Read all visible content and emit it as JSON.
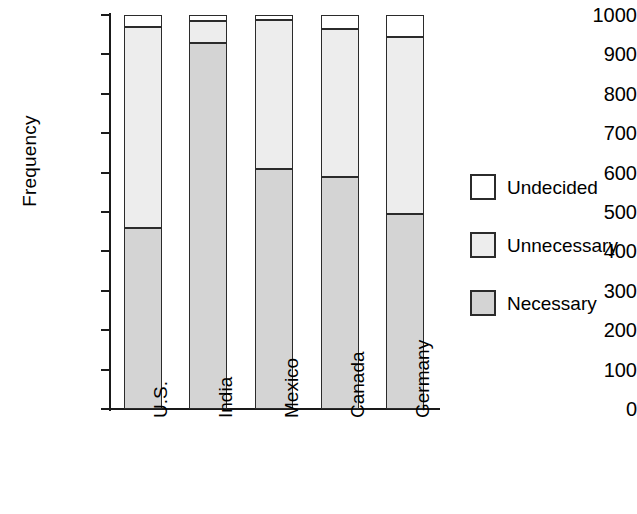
{
  "chart_data": {
    "type": "bar",
    "subtype": "stacked-bar",
    "title": "",
    "xlabel": "",
    "ylabel": "Frequency",
    "categories": [
      "U.S.",
      "India",
      "Mexico",
      "Canada",
      "Germany"
    ],
    "series": [
      {
        "name": "Necessary",
        "color": "#d4d4d4",
        "values": [
          460,
          930,
          610,
          590,
          495
        ]
      },
      {
        "name": "Unnecessary",
        "color": "#ededed",
        "values": [
          510,
          55,
          378,
          375,
          450
        ]
      },
      {
        "name": "Undecided",
        "color": "#ffffff",
        "values": [
          30,
          15,
          12,
          35,
          55
        ]
      }
    ],
    "cumulative_tops": {
      "Necessary": [
        460,
        930,
        610,
        590,
        495
      ],
      "Unnecessary": [
        970,
        985,
        988,
        965,
        945
      ],
      "Undecided": [
        1000,
        1000,
        1000,
        1000,
        1000
      ]
    },
    "ylim": [
      0,
      1000
    ],
    "ytick_values": [
      0,
      100,
      200,
      300,
      400,
      500,
      600,
      700,
      800,
      900,
      1000
    ],
    "ytick_labels": [
      "0",
      "100",
      "200",
      "300",
      "400",
      "500",
      "600",
      "700",
      "800",
      "900",
      "1000"
    ],
    "grid": false,
    "legend_position": "right",
    "legend_entries": [
      {
        "label": "Undecided",
        "color": "#ffffff"
      },
      {
        "label": "Unnecessary",
        "color": "#ededed"
      },
      {
        "label": "Necessary",
        "color": "#d4d4d4"
      }
    ]
  },
  "axis": {
    "y_title": "Frequency"
  }
}
